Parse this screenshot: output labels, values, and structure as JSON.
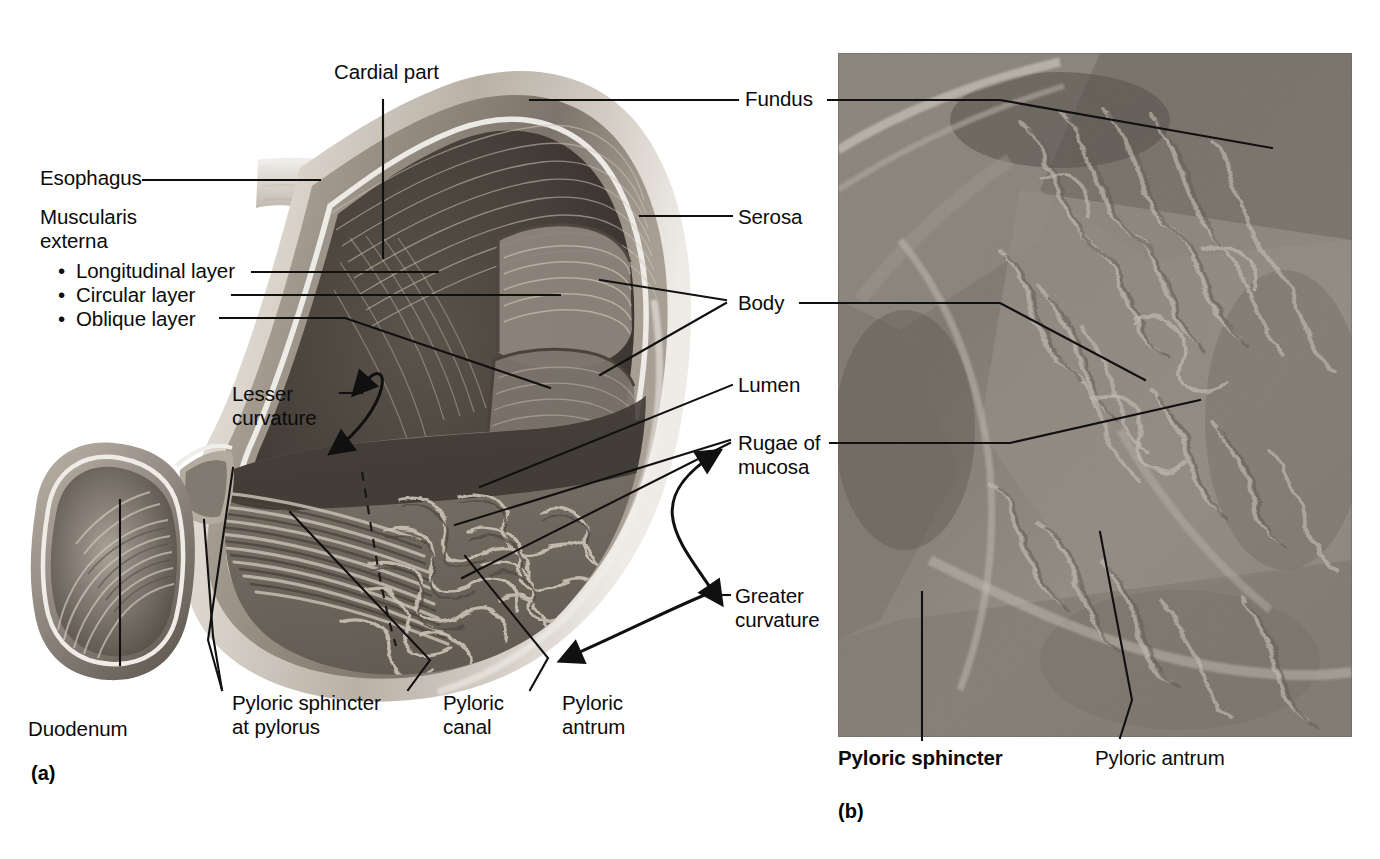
{
  "figure": {
    "kind": "anatomy-figure",
    "panels": [
      {
        "id": "a",
        "tag": "(a)",
        "type": "illustration"
      },
      {
        "id": "b",
        "tag": "(b)",
        "type": "photograph"
      }
    ]
  },
  "colors": {
    "ink": "#0b0b0b",
    "leader": "#101010",
    "paper": "#ffffff",
    "serosa_light": "#e8e4df",
    "muscle_mid": "#9a9186",
    "muscle_dark": "#6d665d",
    "lumen_dark": "#4a443d",
    "lumen_deep": "#2f2b26",
    "rugae_light": "#cfc7bb",
    "photo_mid": "#8d877e"
  },
  "panel_a": {
    "tag": "(a)",
    "labels": {
      "cardial_part": "Cardial part",
      "esophagus": "Esophagus",
      "muscularis_line1": "Muscularis",
      "muscularis_line2": "externa",
      "longitudinal": "Longitudinal layer",
      "circular": "Circular layer",
      "oblique": "Oblique layer",
      "lesser_curvature_line1": "Lesser",
      "lesser_curvature_line2": "curvature",
      "duodenum": "Duodenum",
      "pyloric_sphincter_line1": "Pyloric sphincter",
      "pyloric_sphincter_line2": "at pylorus",
      "pyloric_canal_line1": "Pyloric",
      "pyloric_canal_line2": "canal",
      "pyloric_antrum_line1": "Pyloric",
      "pyloric_antrum_line2": "antrum",
      "greater_curvature_line1": "Greater",
      "greater_curvature_line2": "curvature",
      "bullet": "•"
    }
  },
  "shared_labels": {
    "fundus": "Fundus",
    "serosa": "Serosa",
    "body": "Body",
    "lumen": "Lumen",
    "rugae_line1": "Rugae of",
    "rugae_line2": "mucosa"
  },
  "panel_b": {
    "tag": "(b)",
    "labels": {
      "pyloric_sphincter": "Pyloric sphincter",
      "pyloric_antrum": "Pyloric antrum"
    },
    "photo": {
      "x": 838,
      "y": 53,
      "width": 514,
      "height": 684
    }
  }
}
